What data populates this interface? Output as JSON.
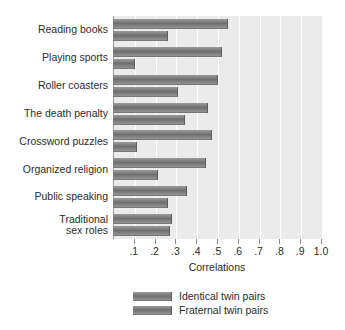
{
  "chart_data": {
    "type": "bar",
    "orientation": "horizontal",
    "title": "",
    "xlabel": "Correlations",
    "ylabel": "",
    "xlim": [
      0,
      1.0
    ],
    "xticks": [
      ".1",
      ".2",
      ".3",
      ".4",
      ".5",
      ".6",
      ".7",
      ".8",
      ".9",
      "1.0"
    ],
    "xtick_values": [
      0.1,
      0.2,
      0.3,
      0.4,
      0.5,
      0.6,
      0.7,
      0.8,
      0.9,
      1.0
    ],
    "grid": true,
    "grid_axis": "x",
    "legend_position": "bottom",
    "categories": [
      "Reading books",
      "Playing sports",
      "Roller coasters",
      "The death penalty",
      "Crossword puzzles",
      "Organized religion",
      "Public speaking",
      "Traditional\nsex roles"
    ],
    "series": [
      {
        "name": "Identical twin pairs",
        "color": "#7a7a7a",
        "values": [
          0.55,
          0.52,
          0.5,
          0.45,
          0.47,
          0.44,
          0.35,
          0.28
        ]
      },
      {
        "name": "Fraternal twin pairs",
        "color": "#7a7a7a",
        "values": [
          0.26,
          0.1,
          0.31,
          0.34,
          0.11,
          0.21,
          0.26,
          0.27
        ]
      }
    ]
  },
  "axis": {
    "x_title": "Correlations"
  },
  "legend": {
    "items": [
      {
        "label": "Identical twin pairs"
      },
      {
        "label": "Fraternal twin pairs"
      }
    ]
  }
}
